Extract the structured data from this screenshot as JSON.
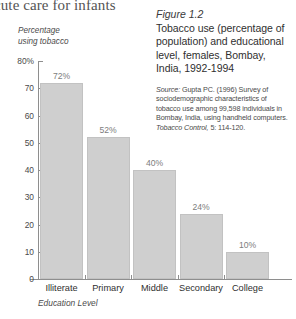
{
  "running_head": "cute care for infants",
  "caption": {
    "figure_number": "Figure 1.2",
    "title": "Tobacco use (percentage of population) and educational level, females, Bombay, India, 1992-1994",
    "source_word": "Source:",
    "source_text": " Gupta PC. (1996) Survey of sociodemographic characteristics of tobacco use among 99,598 individuals in Bombay, India, using handheld computers. ",
    "source_journal": "Tobacco Control,",
    "source_pages": " 5: 114-120."
  },
  "chart_data": {
    "type": "bar",
    "title": "Tobacco use (percentage of population) and educational level, females, Bombay, India, 1992-1994",
    "categories": [
      "Illiterate",
      "Primary",
      "Middle",
      "Secondary",
      "College"
    ],
    "values": [
      72,
      52,
      40,
      24,
      10
    ],
    "data_labels": [
      "72%",
      "52%",
      "40%",
      "24%",
      "10%"
    ],
    "xlabel": "Education Level",
    "ylabel": "Percentage using tobacco",
    "ylabel_line1": "Percentage",
    "ylabel_line2": "using tobacco",
    "ylim": [
      0,
      80
    ],
    "ytick_labels": [
      "80%",
      "70",
      "60",
      "50",
      "40",
      "30",
      "20",
      "10",
      "0"
    ],
    "ytick_values": [
      80,
      70,
      60,
      50,
      40,
      30,
      20,
      10,
      0
    ],
    "grid": false,
    "legend": false,
    "bar_color": "#cfcfcf",
    "axis_color": "#8e8e8e",
    "label_color": "#7d7d7d"
  }
}
